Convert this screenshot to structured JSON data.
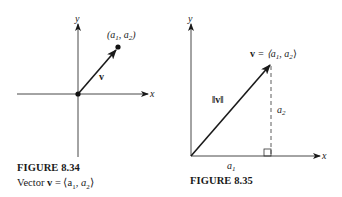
{
  "figures": [
    {
      "id": "fig-8-34",
      "title": "FIGURE 8.34",
      "caption": "Vector v = ⟨a₁, a₂⟩",
      "caption_parts": {
        "prefix": "Vector ",
        "bold_v": "v",
        "rest": " = ⟨a",
        "sub1": "1",
        "mid": ", a",
        "sub2": "2",
        "end": "⟩"
      },
      "axis_labels": {
        "x": "x",
        "y": "y"
      },
      "vector_label": "v",
      "point_label": {
        "open": "(a",
        "sub1": "1",
        "mid": ", a",
        "sub2": "2",
        "close": ")"
      }
    },
    {
      "id": "fig-8-35",
      "title": "FIGURE 8.35",
      "axis_labels": {
        "x": "x",
        "y": "y"
      },
      "vector_label": {
        "bold_v": "v",
        "rest": " = ⟨a",
        "sub1": "1",
        "mid": ", a",
        "sub2": "2",
        "end": "⟩"
      },
      "magnitude_label": "‖v‖",
      "horizontal_leg_label": {
        "base": "a",
        "sub": "1"
      },
      "vertical_leg_label": {
        "base": "a",
        "sub": "2"
      }
    }
  ]
}
